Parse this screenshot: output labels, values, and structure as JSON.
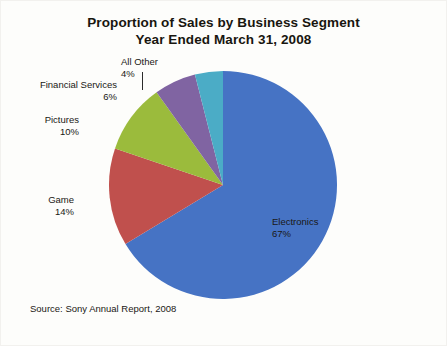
{
  "chart_data": {
    "type": "pie",
    "title": "Proportion of Sales by Business Segment",
    "subtitle": "Year Ended March 31, 2008",
    "title_line1": "Proportion of Sales by Business Segment",
    "title_line2": "Year Ended March 31, 2008",
    "source": "Source: Sony Annual Report, 2008",
    "xlabel": "",
    "ylabel": "",
    "legend_position": "callout-labels",
    "grid": false,
    "categories": [
      "Electronics",
      "Game",
      "Pictures",
      "Financial Services",
      "All Other"
    ],
    "values": [
      67,
      14,
      10,
      6,
      4
    ],
    "value_suffix": "%",
    "slices": [
      {
        "name": "Electronics",
        "value": 67,
        "label": "Electronics",
        "pct": "67%",
        "color": "#4673c4"
      },
      {
        "name": "Game",
        "value": 14,
        "label": "Game",
        "pct": "14%",
        "color": "#c0504d"
      },
      {
        "name": "Pictures",
        "value": 10,
        "label": "Pictures",
        "pct": "10%",
        "color": "#9bbb3c"
      },
      {
        "name": "Financial Services",
        "value": 6,
        "label": "Financial Services",
        "pct": "6%",
        "color": "#8064a2"
      },
      {
        "name": "All Other",
        "value": 4,
        "label": "All Other",
        "pct": "4%",
        "color": "#4bacc6"
      }
    ]
  },
  "colors": {
    "electronics": "#4673c4",
    "game": "#c0504d",
    "pictures": "#9bbb3c",
    "financial_services": "#8064a2",
    "all_other": "#4bacc6",
    "background": "#fdfdfb",
    "text": "#1a1814"
  }
}
